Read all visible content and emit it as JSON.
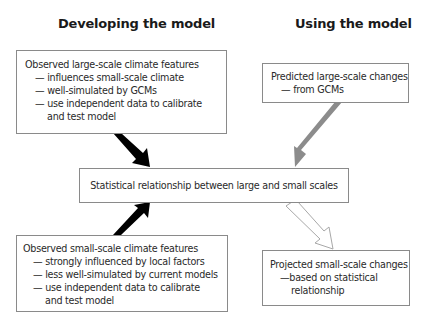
{
  "headings": {
    "left": "Developing the model",
    "right": "Using the model"
  },
  "boxes": {
    "observed_large": {
      "title": "Observed large-scale climate features",
      "bullets": [
        "— influences small-scale climate",
        "— well-simulated by GCMs",
        "— use independent data to calibrate"
      ],
      "continuation": "and test model"
    },
    "predicted_large": {
      "title": "Predicted large-scale changes",
      "bullets": [
        "— from GCMs"
      ]
    },
    "statistical": {
      "title": "Statistical relationship between large and small scales"
    },
    "observed_small": {
      "title": "Observed small-scale climate features",
      "bullets": [
        "— strongly influenced by local factors",
        "— less well-simulated by current models",
        "— use independent data to calibrate"
      ],
      "continuation": "and test model"
    },
    "projected_small": {
      "title": "Projected small-scale changes",
      "bullets": [
        "—based on statistical"
      ],
      "continuation": "relationship"
    }
  },
  "arrows": [
    {
      "from": "observed_large",
      "to": "statistical",
      "style": "solid",
      "color": "#000000"
    },
    {
      "from": "observed_small",
      "to": "statistical",
      "style": "solid",
      "color": "#000000"
    },
    {
      "from": "predicted_large",
      "to": "statistical",
      "style": "solid",
      "color": "#8c8c8c"
    },
    {
      "from": "statistical",
      "to": "projected_small",
      "style": "outline",
      "color": "#9a9a9a"
    }
  ]
}
